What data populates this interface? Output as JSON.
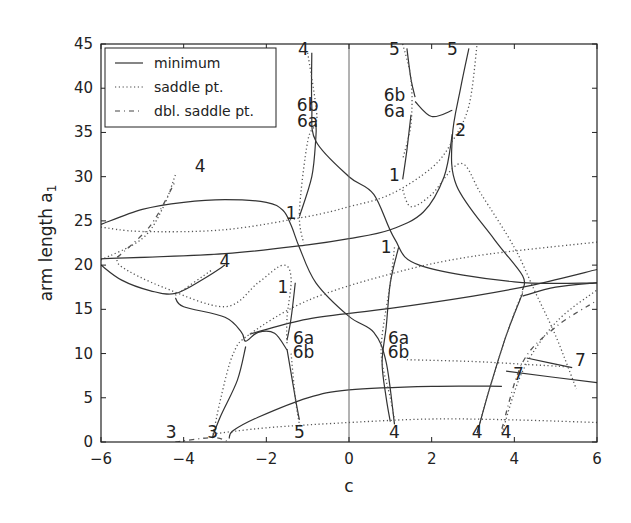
{
  "chart_data": {
    "type": "line",
    "title": "",
    "xlabel": "c",
    "ylabel": "arm length a",
    "ylabel_subscript": "1",
    "xlim": [
      -6,
      6
    ],
    "ylim": [
      0,
      45
    ],
    "xticks": [
      -6,
      -4,
      -2,
      0,
      2,
      4,
      6
    ],
    "xtick_labels": [
      "−6",
      "−4",
      "−2",
      "0",
      "2",
      "4",
      "6"
    ],
    "yticks": [
      0,
      5,
      10,
      15,
      20,
      25,
      30,
      35,
      40,
      45
    ],
    "ytick_labels": [
      "0",
      "5",
      "10",
      "15",
      "20",
      "25",
      "30",
      "35",
      "40",
      "45"
    ],
    "grid": false,
    "vertical_line_at": 0,
    "legend": {
      "position": "upper left",
      "entries": [
        {
          "label": "minimum",
          "style": "solid"
        },
        {
          "label": "saddle pt.",
          "style": "dotted"
        },
        {
          "label": "dbl. saddle pt.",
          "style": "dashdot"
        }
      ]
    },
    "series": [
      {
        "name": "minimum",
        "style": "solid",
        "points": [
          [
            -6,
            20.7
          ],
          [
            -3,
            21.3
          ],
          [
            -1,
            22.3
          ],
          [
            0,
            23
          ],
          [
            1,
            24
          ],
          [
            1.8,
            26
          ],
          [
            2.3,
            30
          ],
          [
            2.5,
            34.8
          ]
        ]
      },
      {
        "name": "minimum",
        "style": "solid",
        "points": [
          [
            -6,
            24.6
          ],
          [
            -5,
            26.3
          ],
          [
            -4,
            27.1
          ],
          [
            -3,
            27.4
          ],
          [
            -2,
            27.1
          ],
          [
            -1.6,
            26.2
          ],
          [
            -1.4,
            24.5
          ],
          [
            -1.2,
            22
          ],
          [
            -0.8,
            18
          ],
          [
            0,
            14.2
          ],
          [
            0.6,
            12.4
          ],
          [
            0.9,
            9
          ],
          [
            1.1,
            2
          ]
        ]
      },
      {
        "name": "minimum",
        "style": "solid",
        "points": [
          [
            -6,
            20
          ],
          [
            -5.5,
            18.3
          ],
          [
            -4.8,
            17.1
          ],
          [
            -4.2,
            16.8
          ],
          [
            -3.5,
            18.5
          ],
          [
            -3,
            20
          ]
        ]
      },
      {
        "name": "minimum",
        "style": "solid",
        "points": [
          [
            -4.2,
            16.3
          ],
          [
            -4,
            15.3
          ],
          [
            -3,
            14.1
          ],
          [
            -2.6,
            12.4
          ],
          [
            -2.5,
            11.4
          ],
          [
            -2.2,
            12.4
          ],
          [
            -1.8,
            12.3
          ],
          [
            -1.5,
            10.4
          ]
        ]
      },
      {
        "name": "minimum",
        "style": "solid",
        "points": [
          [
            -2.4,
            12.2
          ],
          [
            -1,
            13.9
          ],
          [
            1,
            15.1
          ],
          [
            3,
            16.5
          ],
          [
            4.5,
            17.8
          ],
          [
            6,
            19.5
          ]
        ]
      },
      {
        "name": "minimum",
        "style": "solid",
        "points": [
          [
            -2.5,
            10.8
          ],
          [
            -2.7,
            7
          ],
          [
            -3.1,
            3
          ],
          [
            -3.3,
            0.6
          ]
        ]
      },
      {
        "name": "minimum",
        "style": "solid",
        "points": [
          [
            -1.3,
            18
          ],
          [
            -1.4,
            14
          ],
          [
            -1.5,
            11.5
          ]
        ]
      },
      {
        "name": "minimum",
        "style": "solid",
        "points": [
          [
            -1.5,
            10.5
          ],
          [
            -1.3,
            5
          ],
          [
            -1.2,
            2.5
          ]
        ]
      },
      {
        "name": "minimum",
        "style": "solid",
        "points": [
          [
            -2.9,
            0.4
          ],
          [
            -2.8,
            1.3
          ],
          [
            -2.2,
            2.8
          ],
          [
            -1,
            5
          ],
          [
            0,
            5.9
          ],
          [
            2,
            6.3
          ],
          [
            3.7,
            6.3
          ]
        ]
      },
      {
        "name": "minimum",
        "style": "solid",
        "points": [
          [
            -0.9,
            44
          ],
          [
            -0.9,
            38
          ],
          [
            -0.8,
            34
          ],
          [
            0,
            30
          ],
          [
            0.6,
            28
          ],
          [
            1.1,
            23
          ],
          [
            1.7,
            20
          ],
          [
            4,
            18.1
          ],
          [
            6,
            18
          ]
        ]
      },
      {
        "name": "minimum",
        "style": "solid",
        "points": [
          [
            -1.2,
            25.5
          ],
          [
            -0.9,
            30
          ],
          [
            -0.8,
            34.5
          ],
          [
            -0.8,
            36
          ]
        ]
      },
      {
        "name": "minimum",
        "style": "solid",
        "points": [
          [
            1.2,
            22
          ],
          [
            1.0,
            18
          ],
          [
            0.9,
            13
          ],
          [
            0.8,
            9
          ],
          [
            0.9,
            5
          ],
          [
            1.0,
            2.3
          ]
        ]
      },
      {
        "name": "minimum",
        "style": "solid",
        "points": [
          [
            1.4,
            44.5
          ],
          [
            1.5,
            41
          ],
          [
            1.6,
            39
          ]
        ]
      },
      {
        "name": "minimum",
        "style": "solid",
        "points": [
          [
            1.6,
            38.5
          ],
          [
            2,
            36.8
          ],
          [
            2.5,
            37.5
          ]
        ]
      },
      {
        "name": "minimum",
        "style": "solid",
        "points": [
          [
            1.5,
            37
          ],
          [
            1.4,
            33
          ],
          [
            1.3,
            29.7
          ]
        ]
      },
      {
        "name": "minimum",
        "style": "solid",
        "points": [
          [
            2.9,
            44.5
          ],
          [
            2.7,
            40
          ],
          [
            2.5,
            34.5
          ],
          [
            2.6,
            29
          ],
          [
            3.5,
            23
          ],
          [
            4.2,
            18.8
          ],
          [
            4.2,
            17.2
          ]
        ]
      },
      {
        "name": "minimum",
        "style": "solid",
        "points": [
          [
            4.2,
            16.8
          ],
          [
            3.8,
            12
          ],
          [
            3.4,
            6
          ],
          [
            3.1,
            1
          ]
        ]
      },
      {
        "name": "minimum",
        "style": "solid",
        "points": [
          [
            4.2,
            16.5
          ],
          [
            5,
            17.5
          ],
          [
            6,
            18
          ]
        ]
      },
      {
        "name": "minimum",
        "style": "solid",
        "points": [
          [
            3.8,
            8
          ],
          [
            6,
            6.7
          ]
        ]
      },
      {
        "name": "minimum",
        "style": "solid",
        "points": [
          [
            4.3,
            9.5
          ],
          [
            5.4,
            8.4
          ]
        ]
      },
      {
        "name": "saddle pt.",
        "style": "dotted",
        "points": [
          [
            -6,
            24.3
          ],
          [
            -5,
            23.8
          ],
          [
            -3,
            24
          ],
          [
            -1,
            25.5
          ],
          [
            0,
            26.6
          ],
          [
            1,
            28
          ],
          [
            2,
            31
          ],
          [
            2.5,
            34
          ],
          [
            2.9,
            38
          ],
          [
            3.1,
            45
          ]
        ]
      },
      {
        "name": "saddle pt.",
        "style": "dotted",
        "points": [
          [
            -6,
            20.6
          ],
          [
            -5,
            23
          ],
          [
            -4.5,
            26.5
          ],
          [
            -4.2,
            30.2
          ]
        ]
      },
      {
        "name": "saddle pt.",
        "style": "dotted",
        "points": [
          [
            -5.6,
            21
          ],
          [
            -5.5,
            19.8
          ],
          [
            -4.5,
            17.5
          ],
          [
            -3,
            15.3
          ],
          [
            -2.2,
            18
          ],
          [
            -1.6,
            20
          ],
          [
            -1.4,
            18.5
          ],
          [
            -1.5,
            14
          ],
          [
            -1.5,
            11
          ]
        ]
      },
      {
        "name": "saddle pt.",
        "style": "dotted",
        "points": [
          [
            -4.2,
            16.6
          ],
          [
            -3.3,
            19.5
          ]
        ]
      },
      {
        "name": "saddle pt.",
        "style": "dotted",
        "points": [
          [
            -3.3,
            0.5
          ],
          [
            -3.1,
            5
          ],
          [
            -2.8,
            10
          ],
          [
            -2.4,
            12.2
          ],
          [
            -1,
            16
          ],
          [
            1,
            19
          ],
          [
            3,
            21
          ],
          [
            6,
            22.6
          ]
        ]
      },
      {
        "name": "saddle pt.",
        "style": "dotted",
        "points": [
          [
            -3.3,
            0.9
          ],
          [
            -2,
            1.6
          ],
          [
            0,
            2.2
          ],
          [
            2,
            2.6
          ],
          [
            4,
            2.5
          ],
          [
            6,
            2.2
          ]
        ]
      },
      {
        "name": "saddle pt.",
        "style": "dotted",
        "points": [
          [
            -1.4,
            10
          ],
          [
            -1.3,
            5
          ],
          [
            -1.2,
            2
          ]
        ]
      },
      {
        "name": "saddle pt.",
        "style": "dotted",
        "points": [
          [
            -1,
            44
          ],
          [
            -0.8,
            38
          ],
          [
            -0.8,
            36
          ],
          [
            -1,
            34
          ],
          [
            -1.2,
            26
          ],
          [
            -1.1,
            22.5
          ]
        ]
      },
      {
        "name": "saddle pt.",
        "style": "dotted",
        "points": [
          [
            1.1,
            22
          ],
          [
            1,
            18
          ],
          [
            0.8,
            12
          ],
          [
            0.8,
            9
          ],
          [
            1,
            5
          ],
          [
            1.1,
            2.5
          ]
        ]
      },
      {
        "name": "saddle pt.",
        "style": "dotted",
        "points": [
          [
            1.3,
            45
          ],
          [
            1.5,
            41
          ],
          [
            1.5,
            36
          ],
          [
            1.3,
            32
          ]
        ]
      },
      {
        "name": "saddle pt.",
        "style": "dotted",
        "points": [
          [
            1.3,
            28.5
          ],
          [
            1.5,
            26.6
          ],
          [
            2,
            28
          ],
          [
            2.7,
            31.5
          ],
          [
            3.2,
            28
          ],
          [
            4,
            22
          ],
          [
            4.5,
            17
          ],
          [
            5,
            12
          ],
          [
            5.5,
            6
          ]
        ]
      },
      {
        "name": "saddle pt.",
        "style": "dotted",
        "points": [
          [
            1.4,
            9.3
          ],
          [
            3,
            9.1
          ],
          [
            4.2,
            8.8
          ],
          [
            5.3,
            8.5
          ]
        ]
      },
      {
        "name": "saddle pt.",
        "style": "dotted",
        "points": [
          [
            4.2,
            17
          ],
          [
            3.8,
            12
          ],
          [
            3.4,
            6
          ],
          [
            3.1,
            1
          ]
        ]
      },
      {
        "name": "saddle pt.",
        "style": "dotted",
        "points": [
          [
            3.7,
            1
          ],
          [
            4.2,
            8
          ],
          [
            5,
            13.5
          ],
          [
            6,
            17.2
          ]
        ]
      },
      {
        "name": "dbl. saddle pt.",
        "style": "dashdot",
        "points": [
          [
            -5.6,
            20.9
          ],
          [
            -4.8,
            24.5
          ],
          [
            -4.2,
            29.5
          ]
        ]
      },
      {
        "name": "dbl. saddle pt.",
        "style": "dashdot",
        "points": [
          [
            -4.2,
            0
          ],
          [
            -3.3,
            0.5
          ],
          [
            -2.9,
            0
          ]
        ]
      },
      {
        "name": "dbl. saddle pt.",
        "style": "dashdot",
        "points": [
          [
            3.7,
            1.5
          ],
          [
            4.2,
            9
          ],
          [
            5,
            13
          ],
          [
            6,
            16
          ]
        ]
      }
    ],
    "annotations": [
      {
        "text": "4",
        "x": -1.1,
        "y": 43.8
      },
      {
        "text": "6b",
        "x": -1.0,
        "y": 37.4
      },
      {
        "text": "6a",
        "x": -1.0,
        "y": 35.6
      },
      {
        "text": "4",
        "x": -3.6,
        "y": 30.5
      },
      {
        "text": "1",
        "x": -1.4,
        "y": 25.2
      },
      {
        "text": "4",
        "x": -3.0,
        "y": 19.8
      },
      {
        "text": "1",
        "x": -1.6,
        "y": 16.8
      },
      {
        "text": "6a",
        "x": -1.1,
        "y": 11.1
      },
      {
        "text": "6b",
        "x": -1.1,
        "y": 9.5
      },
      {
        "text": "3",
        "x": -4.3,
        "y": 0.5
      },
      {
        "text": "3",
        "x": -3.3,
        "y": 0.5
      },
      {
        "text": "5",
        "x": -1.2,
        "y": 0.5
      },
      {
        "text": "5",
        "x": 1.1,
        "y": 43.8
      },
      {
        "text": "5",
        "x": 2.5,
        "y": 43.8
      },
      {
        "text": "6b",
        "x": 1.1,
        "y": 38.6
      },
      {
        "text": "6a",
        "x": 1.1,
        "y": 36.8
      },
      {
        "text": "2",
        "x": 2.7,
        "y": 34.6
      },
      {
        "text": "1",
        "x": 1.1,
        "y": 29.5
      },
      {
        "text": "1",
        "x": 0.9,
        "y": 21.4
      },
      {
        "text": "6a",
        "x": 1.2,
        "y": 11.1
      },
      {
        "text": "6b",
        "x": 1.2,
        "y": 9.5
      },
      {
        "text": "4",
        "x": 1.1,
        "y": 0.5
      },
      {
        "text": "4",
        "x": 3.1,
        "y": 0.5
      },
      {
        "text": "4",
        "x": 3.8,
        "y": 0.5
      },
      {
        "text": "7",
        "x": 5.6,
        "y": 8.6
      },
      {
        "text": "7",
        "x": 4.1,
        "y": 7.0
      }
    ]
  }
}
